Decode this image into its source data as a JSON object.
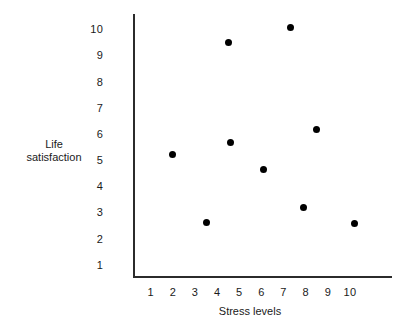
{
  "chart_data": {
    "type": "scatter",
    "title": "",
    "xlabel": "Stress levels",
    "ylabel_lines": [
      "Life",
      "satisfaction"
    ],
    "ylabel": "Life satisfaction",
    "xlim": [
      0.2,
      11.9
    ],
    "ylim": [
      0.55,
      10.6
    ],
    "grid": false,
    "legend": null,
    "xticks": [
      "1",
      "2",
      "3",
      "4",
      "5",
      "6",
      "7",
      "8",
      "9",
      "10"
    ],
    "yticks": [
      "1",
      "2",
      "3",
      "4",
      "5",
      "6",
      "7",
      "8",
      "9",
      "10"
    ],
    "xtick_values": [
      1,
      2,
      3,
      4,
      5,
      6,
      7,
      8,
      9,
      10
    ],
    "ytick_values": [
      1,
      2,
      3,
      4,
      5,
      6,
      7,
      8,
      9,
      10
    ],
    "marker": "filled-circle",
    "marker_color": "#000000",
    "axis_color": "#2b2b2b",
    "background_color": "#ffffff",
    "points": [
      {
        "x": 2.0,
        "y": 5.25
      },
      {
        "x": 3.5,
        "y": 2.65
      },
      {
        "x": 4.5,
        "y": 9.5
      },
      {
        "x": 4.6,
        "y": 5.7
      },
      {
        "x": 6.1,
        "y": 4.65
      },
      {
        "x": 7.3,
        "y": 10.1
      },
      {
        "x": 7.9,
        "y": 3.2
      },
      {
        "x": 8.5,
        "y": 6.2
      },
      {
        "x": 10.2,
        "y": 2.6
      }
    ]
  }
}
